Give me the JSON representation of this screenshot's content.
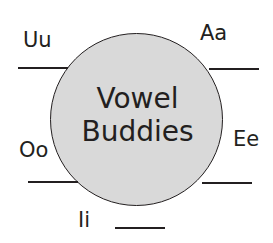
{
  "diagram": {
    "title_line1": "Vowel",
    "title_line2": "Buddies",
    "colors": {
      "circle_fill": "#d9d9d9",
      "stroke": "#231f20",
      "text": "#231f20",
      "background": "#ffffff"
    },
    "vowels": [
      {
        "label": "Uu",
        "position": "upper-left"
      },
      {
        "label": "Aa",
        "position": "upper-right"
      },
      {
        "label": "Oo",
        "position": "lower-left"
      },
      {
        "label": "Ee",
        "position": "lower-right"
      },
      {
        "label": "Ii",
        "position": "bottom"
      }
    ]
  }
}
